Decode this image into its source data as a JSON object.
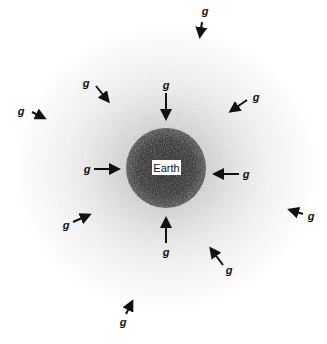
{
  "figure": {
    "earth": {
      "label": "Earth",
      "center": [
        166,
        168
      ],
      "core_radius": 40,
      "core_color": "#3a3a3a"
    },
    "field_label": "g",
    "arrow_color": "#111111",
    "vectors": [
      {
        "id": "top",
        "label": "g",
        "label_pos": [
          205,
          15
        ],
        "from": [
          202,
          22
        ],
        "to": [
          200,
          36
        ]
      },
      {
        "id": "upper-left",
        "label": "g",
        "label_pos": [
          86,
          87
        ],
        "from": [
          96,
          86
        ],
        "to": [
          108,
          101
        ]
      },
      {
        "id": "upper-center",
        "label": "g",
        "label_pos": [
          166,
          89
        ],
        "from": [
          166,
          93
        ],
        "to": [
          166,
          118
        ]
      },
      {
        "id": "upper-right",
        "label": "g",
        "label_pos": [
          256,
          101
        ],
        "from": [
          247,
          100
        ],
        "to": [
          231,
          111
        ]
      },
      {
        "id": "far-left",
        "label": "g",
        "label_pos": [
          21,
          115
        ],
        "from": [
          32,
          112
        ],
        "to": [
          44,
          118
        ]
      },
      {
        "id": "left",
        "label": "g",
        "label_pos": [
          87,
          173
        ],
        "from": [
          94,
          169
        ],
        "to": [
          118,
          169
        ]
      },
      {
        "id": "right",
        "label": "g",
        "label_pos": [
          246,
          178
        ],
        "from": [
          239,
          174
        ],
        "to": [
          215,
          174
        ]
      },
      {
        "id": "far-right",
        "label": "g",
        "label_pos": [
          311,
          220
        ],
        "from": [
          303,
          214
        ],
        "to": [
          290,
          210
        ]
      },
      {
        "id": "lower-left",
        "label": "g",
        "label_pos": [
          66,
          229
        ],
        "from": [
          73,
          222
        ],
        "to": [
          89,
          215
        ]
      },
      {
        "id": "lower-center",
        "label": "g",
        "label_pos": [
          166,
          256
        ],
        "from": [
          166,
          243
        ],
        "to": [
          166,
          219
        ]
      },
      {
        "id": "lower-right",
        "label": "g",
        "label_pos": [
          229,
          274
        ],
        "from": [
          223,
          265
        ],
        "to": [
          211,
          249
        ]
      },
      {
        "id": "bottom",
        "label": "g",
        "label_pos": [
          123,
          326
        ],
        "from": [
          126,
          314
        ],
        "to": [
          132,
          302
        ]
      }
    ]
  }
}
